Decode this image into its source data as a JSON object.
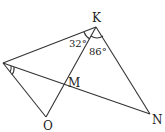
{
  "diagram": {
    "points": {
      "K": {
        "label": "K",
        "x": 96,
        "y": 27
      },
      "A": {
        "label": "",
        "x": 3,
        "y": 63
      },
      "O": {
        "label": "O",
        "x": 46,
        "y": 117
      },
      "N": {
        "label": "N",
        "x": 150,
        "y": 114
      },
      "M": {
        "label": "M",
        "x": 65,
        "y": 85
      }
    },
    "angles": {
      "AKO": "32°",
      "OKN": "86°"
    },
    "segments": [
      "AK",
      "KO",
      "KN",
      "AO",
      "AN"
    ],
    "stroke_color": "#333333"
  }
}
